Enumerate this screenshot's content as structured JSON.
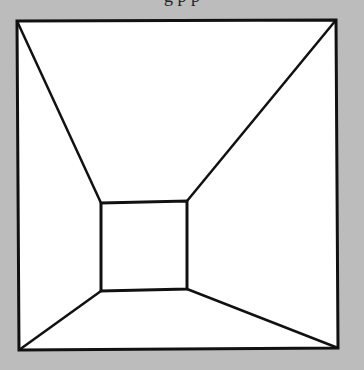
{
  "caption_fragment": "g                 p p",
  "diagram": {
    "background_color": "#bcbcbc",
    "fill_color": "#ffffff",
    "stroke_color": "#111111",
    "outer_square": [
      [
        17,
        21
      ],
      [
        336,
        20
      ],
      [
        338,
        348
      ],
      [
        19,
        350
      ]
    ],
    "inner_square": [
      [
        101,
        203
      ],
      [
        187,
        201
      ],
      [
        187,
        289
      ],
      [
        101,
        291
      ]
    ]
  }
}
